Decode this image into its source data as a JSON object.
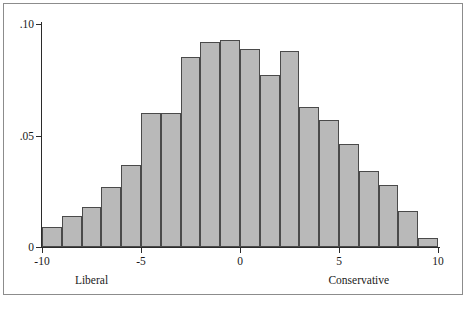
{
  "figure": {
    "background_color": "#ffffff",
    "frame_color": "#8c8c8c",
    "axis_color": "#2b2b2b",
    "bar_fill_color": "#b9b9b9",
    "bar_edge_color": "#4a4a4a"
  },
  "axes": {
    "y_ticks": [
      {
        "value": 0,
        "label": "0"
      },
      {
        "value": 0.05,
        "label": ".05"
      },
      {
        "value": 0.1,
        "label": ".10"
      }
    ],
    "x_ticks": [
      {
        "value": -10,
        "label": "-10"
      },
      {
        "value": -5,
        "label": "-5"
      },
      {
        "value": 0,
        "label": "0"
      },
      {
        "value": 5,
        "label": "5"
      },
      {
        "value": 10,
        "label": "10"
      }
    ],
    "x_anchors": [
      {
        "value": -7.5,
        "label": "Liberal"
      },
      {
        "value": 6.0,
        "label": "Conservative"
      }
    ]
  },
  "chart_data": {
    "type": "bar",
    "title": "",
    "subtitle": "",
    "xlabel": "",
    "ylabel": "",
    "xlim": [
      -10,
      10
    ],
    "ylim": [
      0,
      0.105
    ],
    "grid": false,
    "legend": null,
    "bin_width": 1,
    "categories": [
      "-10 to -9",
      "-9 to -8",
      "-8 to -7",
      "-7 to -6",
      "-6 to -5",
      "-5 to -4",
      "-4 to -3",
      "-3 to -2",
      "-2 to -1",
      "-1 to 0",
      "0 to 1",
      "1 to 2",
      "2 to 3",
      "3 to 4",
      "4 to 5",
      "5 to 6",
      "6 to 7",
      "7 to 8",
      "8 to 9",
      "9 to 10"
    ],
    "bin_starts": [
      -10,
      -9,
      -8,
      -7,
      -6,
      -5,
      -4,
      -3,
      -2,
      -1,
      0,
      1,
      2,
      3,
      4,
      5,
      6,
      7,
      8,
      9
    ],
    "bin_ends": [
      -9,
      -8,
      -7,
      -6,
      -5,
      -4,
      -3,
      -2,
      -1,
      0,
      1,
      2,
      3,
      4,
      5,
      6,
      7,
      8,
      9,
      10
    ],
    "values": [
      0.009,
      0.014,
      0.018,
      0.027,
      0.037,
      0.06,
      0.06,
      0.085,
      0.092,
      0.093,
      0.089,
      0.077,
      0.088,
      0.063,
      0.057,
      0.046,
      0.034,
      0.028,
      0.016,
      0.004
    ],
    "ylabel_format": "density"
  }
}
